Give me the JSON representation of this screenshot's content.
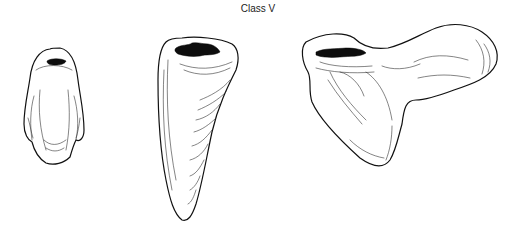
{
  "figure": {
    "title": "Class V",
    "teeth": [
      {
        "name": "incisor-facial-view",
        "label": ""
      },
      {
        "name": "canine-facial-view",
        "label": ""
      },
      {
        "name": "molar-facial-view",
        "label": ""
      }
    ]
  }
}
